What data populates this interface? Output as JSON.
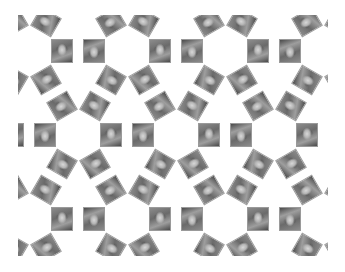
{
  "image": {
    "description": "Rhombitrihexagonal tessellation of grayscale portrait photo tiles around white hexagonal holes",
    "width": 345,
    "height": 272,
    "background": "#ffffff"
  },
  "pattern": {
    "clip": {
      "x": 18,
      "y": 15,
      "width": 310,
      "height": 241
    },
    "hex_period_x": 98,
    "hex_period_y": 84,
    "row_offset_x": 49,
    "first_hex_center": {
      "x": 29,
      "y": 51
    },
    "hex_rows": 4,
    "hex_cols": 5,
    "tile_distance": 33,
    "tile_width": 22,
    "tile_height": 24,
    "tile_angles_deg": [
      0,
      60,
      120,
      180,
      240,
      300
    ],
    "tile_tone": "grayscale"
  }
}
